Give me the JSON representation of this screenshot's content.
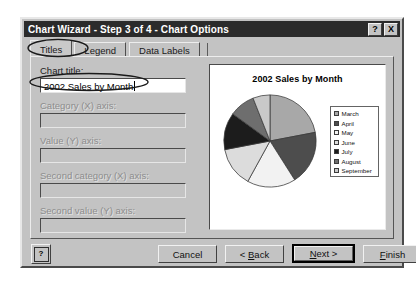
{
  "window": {
    "title": "Chart Wizard - Step 3 of 4 - Chart Options",
    "help_button": "?",
    "close_button": "X"
  },
  "tabs": [
    {
      "label": "Titles",
      "active": true
    },
    {
      "label": "Legend",
      "active": false
    },
    {
      "label": "Data Labels",
      "active": false
    }
  ],
  "form": {
    "chart_title": {
      "label": "Chart title:",
      "value": "2002 Sales by Month",
      "placeholder": "",
      "disabled": false
    },
    "category_x": {
      "label": "Category (X) axis:",
      "value": "",
      "placeholder": "",
      "disabled": true
    },
    "value_y": {
      "label": "Value (Y) axis:",
      "value": "",
      "placeholder": "",
      "disabled": true
    },
    "second_category_x": {
      "label": "Second category (X) axis:",
      "value": "",
      "placeholder": "",
      "disabled": true
    },
    "second_value_y": {
      "label": "Second value (Y) axis:",
      "value": "",
      "placeholder": "",
      "disabled": true
    }
  },
  "preview": {
    "title": "2002 Sales by Month"
  },
  "chart_data": {
    "type": "pie",
    "title": "2002 Sales by Month",
    "xlabel": "",
    "ylabel": "",
    "legend_position": "right",
    "grid": false,
    "categories": [
      "March",
      "April",
      "May",
      "June",
      "July",
      "August",
      "September"
    ],
    "values": [
      22,
      19,
      17,
      14,
      13,
      9,
      6
    ],
    "colors": [
      "#a8a8a8",
      "#4d4d4d",
      "#f2f2f2",
      "#dcdcdc",
      "#1c1c1c",
      "#6e6e6e",
      "#c9c9c9"
    ],
    "legend": [
      {
        "label": "March",
        "color": "#a8a8a8"
      },
      {
        "label": "April",
        "color": "#4d4d4d"
      },
      {
        "label": "May",
        "color": "#f2f2f2"
      },
      {
        "label": "June",
        "color": "#dcdcdc"
      },
      {
        "label": "July",
        "color": "#1c1c1c"
      },
      {
        "label": "August",
        "color": "#6e6e6e"
      },
      {
        "label": "September",
        "color": "#c9c9c9"
      }
    ]
  },
  "buttons": {
    "help": "?",
    "cancel": "Cancel",
    "back_prefix": "< ",
    "back_accel": "B",
    "back_suffix": "ack",
    "next_accel": "N",
    "next_suffix": "ext >",
    "finish_accel": "F",
    "finish_suffix": "inish"
  }
}
